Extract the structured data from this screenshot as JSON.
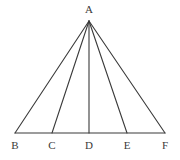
{
  "figure": {
    "background_color": "#ffffff",
    "stroke_color": "#3a3a3a",
    "label_color": "#3a3a3a",
    "stroke_width": 1.1,
    "canvas": {
      "width": 180,
      "height": 160
    }
  },
  "points": [
    {
      "id": "A",
      "label": "A",
      "x": 89,
      "y": 21,
      "label_x": 89,
      "label_y": 4,
      "role": "apex"
    },
    {
      "id": "B",
      "label": "B",
      "x": 15,
      "y": 133,
      "label_x": 15,
      "label_y": 140,
      "role": "base-endpoint-left"
    },
    {
      "id": "C",
      "label": "C",
      "x": 52,
      "y": 133,
      "label_x": 52,
      "label_y": 140,
      "role": "base-division"
    },
    {
      "id": "D",
      "label": "D",
      "x": 89,
      "y": 133,
      "label_x": 89,
      "label_y": 140,
      "role": "base-midpoint"
    },
    {
      "id": "E",
      "label": "E",
      "x": 127,
      "y": 133,
      "label_x": 127,
      "label_y": 140,
      "role": "base-division"
    },
    {
      "id": "F",
      "label": "F",
      "x": 165,
      "y": 133,
      "label_x": 165,
      "label_y": 140,
      "role": "base-endpoint-right"
    }
  ],
  "segments": [
    {
      "id": "AB",
      "name": "segment-ab",
      "from": "A",
      "to": "B",
      "x1": 89,
      "y1": 21,
      "x2": 15,
      "y2": 133
    },
    {
      "id": "AC",
      "name": "segment-ac",
      "from": "A",
      "to": "C",
      "x1": 89,
      "y1": 21,
      "x2": 52,
      "y2": 133
    },
    {
      "id": "AD",
      "name": "segment-ad",
      "from": "A",
      "to": "D",
      "x1": 89,
      "y1": 21,
      "x2": 89,
      "y2": 133
    },
    {
      "id": "AE",
      "name": "segment-ae",
      "from": "A",
      "to": "E",
      "x1": 89,
      "y1": 21,
      "x2": 127,
      "y2": 133
    },
    {
      "id": "AF",
      "name": "segment-af",
      "from": "A",
      "to": "F",
      "x1": 89,
      "y1": 21,
      "x2": 165,
      "y2": 133
    },
    {
      "id": "BF",
      "name": "segment-bf-baseline",
      "from": "B",
      "to": "F",
      "x1": 15,
      "y1": 133,
      "x2": 165,
      "y2": 133
    }
  ]
}
